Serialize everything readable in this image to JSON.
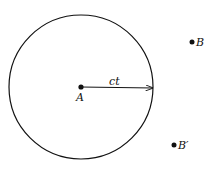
{
  "diagram": {
    "circle": {
      "cx": 81,
      "cy": 87,
      "r": 72
    },
    "center_point": {
      "label": "A",
      "x": 81,
      "y": 87
    },
    "radius_arrow": {
      "label": "ct",
      "x1": 81,
      "y1": 87,
      "x2": 153,
      "y2": 88
    },
    "points": [
      {
        "label": "B",
        "x": 192,
        "y": 42
      },
      {
        "label": "B′",
        "x": 174,
        "y": 145
      }
    ],
    "colors": {
      "stroke": "#111111",
      "background": "#ffffff"
    }
  }
}
